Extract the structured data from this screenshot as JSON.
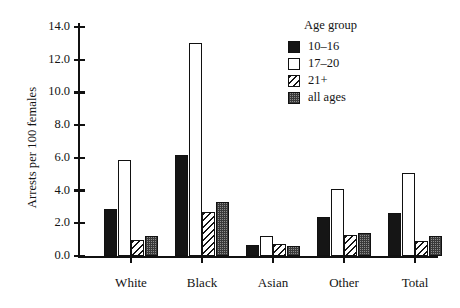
{
  "chart_data": {
    "type": "bar",
    "title": "",
    "xlabel": "",
    "ylabel": "Arrests per 100 females",
    "ylim": [
      0.0,
      14.0
    ],
    "ytick_step": 2.0,
    "yticks": [
      "0.0",
      "2.0",
      "4.0",
      "6.0",
      "8.0",
      "10.0",
      "12.0",
      "14.0"
    ],
    "grid": false,
    "legend_position": "top-right",
    "legend_title": "Age group",
    "categories": [
      "White",
      "Black",
      "Asian",
      "Other",
      "Total"
    ],
    "series": [
      {
        "name": "10–16",
        "fill": "solid",
        "values": [
          2.9,
          6.2,
          0.7,
          2.4,
          2.6
        ]
      },
      {
        "name": "17–20",
        "fill": "empty",
        "values": [
          5.9,
          13.0,
          1.25,
          4.1,
          5.1
        ]
      },
      {
        "name": "21+",
        "fill": "hatch",
        "values": [
          1.0,
          2.7,
          0.75,
          1.3,
          0.9
        ]
      },
      {
        "name": "all ages",
        "fill": "checker",
        "values": [
          1.25,
          3.3,
          0.6,
          1.4,
          1.2
        ]
      }
    ],
    "colors": {
      "axis": "#111111",
      "solid": "#151515",
      "empty": "#ffffff",
      "hatch": "#151515",
      "checker": "#8d8d8d",
      "background": "#ffffff"
    }
  }
}
